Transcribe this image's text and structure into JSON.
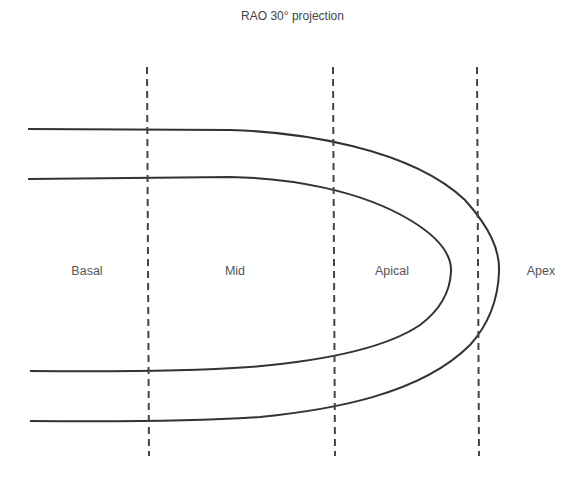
{
  "diagram": {
    "title": "RAO 30° projection",
    "segments": [
      {
        "label": "Basal",
        "x": 87
      },
      {
        "label": "Mid",
        "x": 235
      },
      {
        "label": "Apical",
        "x": 392
      },
      {
        "label": "Apex",
        "x": 541
      }
    ],
    "divider_count": 3,
    "colors": {
      "line": "#333333",
      "dashed": "#444444",
      "text": "#555555"
    }
  }
}
